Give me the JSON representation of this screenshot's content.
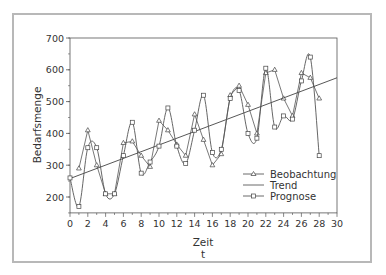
{
  "chart_data": {
    "type": "line",
    "title": "",
    "xlabel": "Zeit",
    "xlabel_sub": "t",
    "ylabel": "Bedarfsmenge",
    "xlim": [
      0,
      30
    ],
    "ylim": [
      150,
      700
    ],
    "x_ticks": [
      0,
      2,
      4,
      6,
      8,
      10,
      12,
      14,
      16,
      18,
      20,
      22,
      24,
      26,
      28,
      30
    ],
    "y_ticks": [
      200,
      300,
      400,
      500,
      600,
      700
    ],
    "grid": false,
    "legend_position": "lower right",
    "series": [
      {
        "name": "Beobachtung",
        "marker": "triangle",
        "x": [
          1,
          2,
          3,
          4,
          5,
          6,
          7,
          8,
          9,
          10,
          11,
          12,
          13,
          14,
          15,
          16,
          17,
          18,
          19,
          20,
          21,
          22,
          23,
          24,
          25,
          26,
          27,
          28
        ],
        "values": [
          290,
          410,
          300,
          210,
          210,
          370,
          375,
          330,
          295,
          440,
          410,
          365,
          330,
          460,
          380,
          300,
          335,
          520,
          550,
          490,
          400,
          590,
          600,
          510,
          455,
          590,
          575,
          510
        ]
      },
      {
        "name": "Trend",
        "marker": "none",
        "x": [
          0,
          30
        ],
        "values": [
          258,
          575
        ]
      },
      {
        "name": "Prognose",
        "marker": "square",
        "x": [
          0,
          1,
          2,
          3,
          4,
          5,
          6,
          7,
          8,
          9,
          10,
          11,
          12,
          13,
          14,
          15,
          16,
          17,
          18,
          19,
          20,
          21,
          22,
          23,
          24,
          25,
          26,
          27,
          28
        ],
        "values": [
          260,
          170,
          355,
          355,
          210,
          210,
          330,
          435,
          275,
          310,
          360,
          480,
          360,
          305,
          410,
          520,
          340,
          350,
          510,
          535,
          400,
          385,
          605,
          420,
          455,
          445,
          565,
          640,
          330
        ]
      }
    ]
  },
  "legend": {
    "items": [
      {
        "label": "Beobachtung"
      },
      {
        "label": "Trend"
      },
      {
        "label": "Prognose"
      }
    ]
  },
  "axes": {
    "y_title": "Bedarfsmenge",
    "x_title": "Zeit",
    "x_subtitle": "t"
  }
}
